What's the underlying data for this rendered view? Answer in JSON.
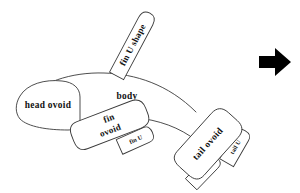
{
  "figure": {
    "background_color": "#ffffff",
    "stroke_color": "#3a3a3a",
    "text_color": "#111111",
    "arrow_color": "#000000"
  },
  "shapes": [
    {
      "id": "fin-u-shape",
      "label": "fin U shape",
      "kind": "u-shape",
      "rotation_deg": -62,
      "center": {
        "x": 133,
        "y": 45
      }
    },
    {
      "id": "head-ovoid",
      "label": "head ovoid",
      "kind": "ovoid",
      "rotation_deg": 0,
      "center": {
        "x": 47,
        "y": 105
      }
    },
    {
      "id": "body",
      "label": "body",
      "kind": "open-curve",
      "rotation_deg": 0,
      "center": {
        "x": 127,
        "y": 96
      }
    },
    {
      "id": "fin-ovoid",
      "label": "fin ovoid",
      "label_lines": [
        "fin",
        "ovoid"
      ],
      "kind": "ovoid",
      "rotation_deg": -21,
      "center": {
        "x": 110,
        "y": 124
      }
    },
    {
      "id": "fin-u",
      "label": "fin U",
      "kind": "u-shape",
      "rotation_deg": -24,
      "center": {
        "x": 135,
        "y": 140
      }
    },
    {
      "id": "tail-ovoid",
      "label": "tail ovoid",
      "kind": "ovoid",
      "rotation_deg": -48,
      "center": {
        "x": 208,
        "y": 144
      }
    },
    {
      "id": "tail-u-right",
      "label": "tail U",
      "kind": "u-shape",
      "rotation_deg": -60,
      "center": {
        "x": 235,
        "y": 148
      }
    },
    {
      "id": "tail-u-bottom",
      "label": "tail U",
      "kind": "u-shape",
      "rotation_deg": -46,
      "center": {
        "x": 203,
        "y": 172
      }
    }
  ],
  "arrow": {
    "name": "right-arrow",
    "direction": "right",
    "center": {
      "x": 274,
      "y": 62
    }
  }
}
